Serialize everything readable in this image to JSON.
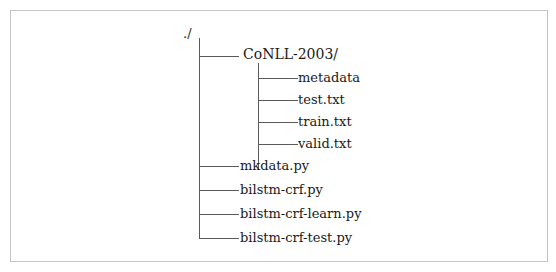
{
  "tree": {
    "root": "./",
    "children": [
      {
        "name": "CoNLL-2003/",
        "type": "folder",
        "children": [
          {
            "name": "metadata",
            "type": "file"
          },
          {
            "name": "test.txt",
            "type": "file"
          },
          {
            "name": "train.txt",
            "type": "file"
          },
          {
            "name": "valid.txt",
            "type": "file"
          }
        ]
      },
      {
        "name": "mkdata.py",
        "type": "file"
      },
      {
        "name": "bilstm-crf.py",
        "type": "file"
      },
      {
        "name": "bilstm-crf-learn.py",
        "type": "file"
      },
      {
        "name": "bilstm-crf-test.py",
        "type": "file"
      }
    ]
  },
  "colors": {
    "line": "#5a5a5a",
    "border": "#c4c4c4",
    "text": "#1a1a1a",
    "background": "#ffffff"
  }
}
